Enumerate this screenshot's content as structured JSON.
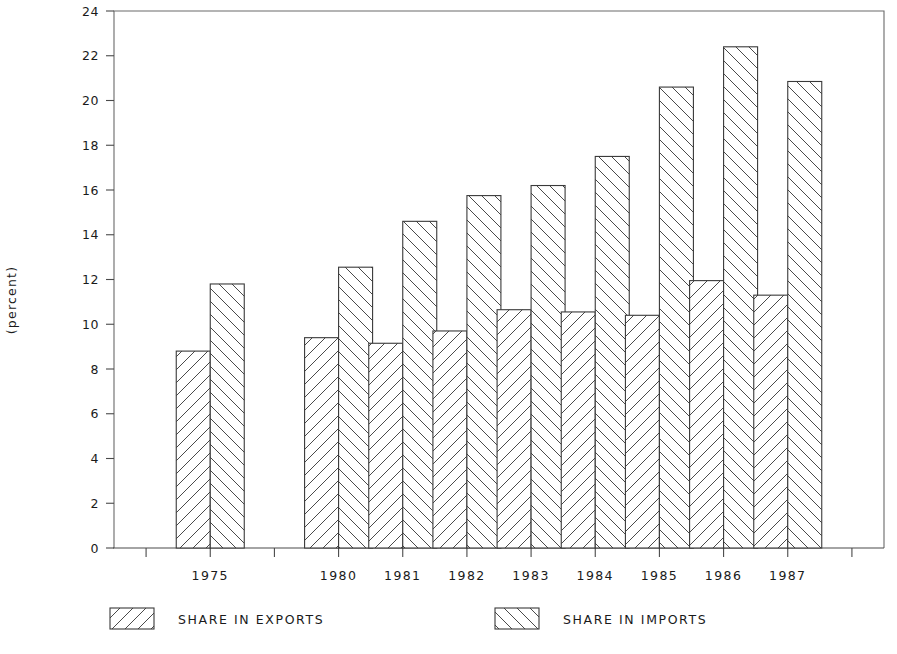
{
  "chart_data": {
    "type": "bar",
    "title": "",
    "subtitle": "",
    "xlabel": "",
    "ylabel": "(percent)",
    "categories": [
      "1975",
      "1980",
      "1981",
      "1982",
      "1983",
      "1984",
      "1985",
      "1986",
      "1987"
    ],
    "series": [
      {
        "name": "SHARE IN EXPORTS",
        "values": [
          8.8,
          9.4,
          9.15,
          9.7,
          10.65,
          10.55,
          10.4,
          11.95,
          11.3
        ],
        "pattern": "forward-hatch"
      },
      {
        "name": "SHARE IN IMPORTS",
        "values": [
          11.8,
          12.55,
          14.6,
          15.75,
          16.2,
          17.5,
          20.6,
          22.4,
          20.85
        ],
        "pattern": "backward-hatch"
      }
    ],
    "ylim": [
      0,
      24
    ],
    "yticks": [
      0,
      2,
      4,
      6,
      8,
      10,
      12,
      14,
      16,
      18,
      20,
      22,
      24
    ],
    "ytick_labels": [
      "0",
      "2",
      "4",
      "6",
      "8",
      "10",
      "12",
      "14",
      "16",
      "18",
      "20",
      "22",
      "24"
    ],
    "grid": false,
    "legend_position": "bottom",
    "x_gap_after_index": 0,
    "axis_color": "#4a4a4a",
    "bar_edge_color": "#3a3a3a",
    "bar_fill_color": "#ffffff",
    "background_color": "#ffffff"
  },
  "legend": {
    "entries": [
      {
        "label": "SHARE IN EXPORTS",
        "swatch": "forward-hatch-swatch"
      },
      {
        "label": "SHARE IN IMPORTS",
        "swatch": "backward-hatch-swatch"
      }
    ]
  }
}
